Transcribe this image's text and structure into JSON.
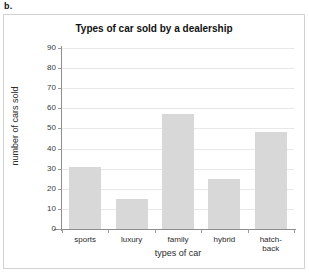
{
  "part_label": "b.",
  "chart_data": {
    "type": "bar",
    "title": "Types of car sold by a dealership",
    "xlabel": "types of car",
    "ylabel": "number of cars sold",
    "categories": [
      "sports",
      "luxury",
      "family",
      "hybrid",
      "hatch-\nback"
    ],
    "category_lines": [
      [
        "sports"
      ],
      [
        "luxury"
      ],
      [
        "family"
      ],
      [
        "hybrid"
      ],
      [
        "hatch-",
        "back"
      ]
    ],
    "values": [
      31,
      15,
      57,
      25,
      48
    ],
    "ylim": [
      0,
      90
    ],
    "ytick_step": 10,
    "yticks": [
      0,
      10,
      20,
      30,
      40,
      50,
      60,
      70,
      80,
      90
    ],
    "ytick_labels": [
      "0",
      "10",
      "20",
      "30",
      "40",
      "50",
      "60",
      "70",
      "80",
      "90"
    ],
    "grid": true,
    "grid_axis": "y",
    "legend": false,
    "bar_color": "#d8d8d8",
    "axis_color": "#8d8d8d",
    "grid_color": "#e8e8e8",
    "frame_color": "#d2d2d2"
  }
}
